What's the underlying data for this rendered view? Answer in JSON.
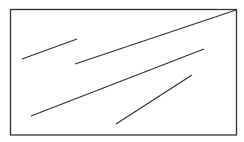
{
  "diagram": {
    "stroke_color": "#333333",
    "frame": {
      "x": 10.5,
      "y": 9.5,
      "width": 226,
      "height": 125.5
    },
    "segments": [
      {
        "x1": 22,
        "y1": 59,
        "x2": 77,
        "y2": 39
      },
      {
        "x1": 75,
        "y1": 64,
        "x2": 236,
        "y2": 10
      },
      {
        "x1": 31,
        "y1": 116,
        "x2": 204,
        "y2": 49
      },
      {
        "x1": 116,
        "y1": 124,
        "x2": 192,
        "y2": 75
      }
    ]
  }
}
